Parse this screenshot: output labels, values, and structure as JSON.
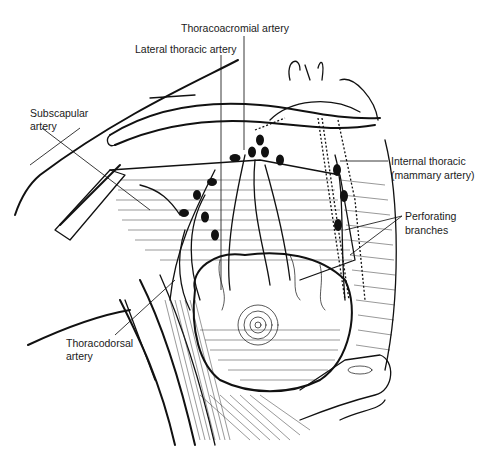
{
  "figure": {
    "background": "#ffffff",
    "line_color": "#111111"
  },
  "labels": [
    {
      "id": "thoracoacromial",
      "text": "Thoracoacromial artery",
      "x": 181,
      "y": 22
    },
    {
      "id": "lateral_thoracic",
      "text": "Lateral thoracic artery",
      "x": 135,
      "y": 43
    },
    {
      "id": "subscapular_1",
      "text": "Subscapular",
      "x": 30,
      "y": 107
    },
    {
      "id": "subscapular_2",
      "text": "artery",
      "x": 30,
      "y": 120
    },
    {
      "id": "internal_thoracic_1",
      "text": "Internal thoracic",
      "x": 391,
      "y": 155
    },
    {
      "id": "internal_thoracic_2",
      "text": "(mammary artery)",
      "x": 391,
      "y": 169
    },
    {
      "id": "perforating_1",
      "text": "Perforating",
      "x": 405,
      "y": 210
    },
    {
      "id": "perforating_2",
      "text": "branches",
      "x": 405,
      "y": 224
    },
    {
      "id": "thoracodorsal_1",
      "text": "Thoracodorsal",
      "x": 66,
      "y": 337
    },
    {
      "id": "thoracodorsal_2",
      "text": "artery",
      "x": 66,
      "y": 350
    }
  ]
}
